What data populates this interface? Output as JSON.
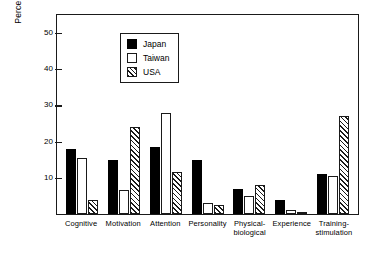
{
  "chart_data": {
    "type": "bar",
    "title": "",
    "xlabel": "",
    "ylabel": "Percent of mothers",
    "ylim": [
      0,
      55
    ],
    "yticks": [
      10,
      20,
      30,
      40,
      50
    ],
    "grid": false,
    "legend_position": "top-left",
    "categories": [
      "Cognitive",
      "Motivation",
      "Attention",
      "Personality",
      "Physical-biological",
      "Experience",
      "Training-stimulation"
    ],
    "category_lines": [
      [
        "Cognitive"
      ],
      [
        "Motivation"
      ],
      [
        "Attention"
      ],
      [
        "Personality"
      ],
      [
        "Physical-",
        "biological"
      ],
      [
        "Experience"
      ],
      [
        "Training-",
        "stimulation"
      ]
    ],
    "series": [
      {
        "name": "Japan",
        "fill": "solid-black",
        "color": "#000000",
        "values": [
          18,
          15,
          18.5,
          15,
          7,
          4,
          11
        ]
      },
      {
        "name": "Taiwan",
        "fill": "white-open",
        "color": "#ffffff",
        "values": [
          15.5,
          6.5,
          28,
          3,
          5,
          1,
          10.5
        ]
      },
      {
        "name": "USA",
        "fill": "diagonal-hatch",
        "color": "#ffffff",
        "values": [
          4,
          24,
          11.5,
          2.5,
          8,
          0.5,
          27
        ]
      }
    ]
  },
  "legend": {
    "items": [
      {
        "label": "Japan",
        "swatch": "japan"
      },
      {
        "label": "Taiwan",
        "swatch": "taiwan"
      },
      {
        "label": "USA",
        "swatch": "usa"
      }
    ]
  },
  "axis": {
    "y_title": "Percent of mothers",
    "y_tick_labels": [
      "50",
      "40",
      "30",
      "20",
      "10"
    ]
  }
}
